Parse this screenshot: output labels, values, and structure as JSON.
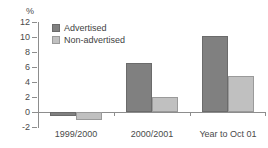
{
  "chart_data": {
    "type": "bar",
    "title": "",
    "subtitle": "",
    "unit_label": "%",
    "xlabel": "",
    "ylabel": "",
    "ylim": [
      -2,
      12
    ],
    "yticks": [
      -2,
      0,
      2,
      4,
      6,
      8,
      10,
      12
    ],
    "ytick_labels": [
      "-2",
      "0",
      "2",
      "4",
      "6",
      "8",
      "10",
      "12"
    ],
    "grid": false,
    "legend_position": "top-left",
    "categories": [
      "1999/2000",
      "2000/2001",
      "Year to Oct 01"
    ],
    "series": [
      {
        "name": "Advertised",
        "color": "#808080",
        "values": [
          -0.5,
          6.5,
          10.2
        ]
      },
      {
        "name": "Non-advertised",
        "color": "#c0c0c0",
        "values": [
          -1.1,
          2.0,
          4.8
        ]
      }
    ]
  },
  "axis": {
    "unit": "%",
    "ticks": [
      {
        "label": "12",
        "value": 12
      },
      {
        "label": "10",
        "value": 10
      },
      {
        "label": "8",
        "value": 8
      },
      {
        "label": "6",
        "value": 6
      },
      {
        "label": "4",
        "value": 4
      },
      {
        "label": "2",
        "value": 2
      },
      {
        "label": "0",
        "value": 0
      },
      {
        "label": "-2",
        "value": -2
      }
    ]
  },
  "legend": {
    "items": [
      {
        "label": "Advertised",
        "color": "#808080"
      },
      {
        "label": "Non-advertised",
        "color": "#c0c0c0"
      }
    ]
  },
  "categories": [
    {
      "label": "1999/2000"
    },
    {
      "label": "2000/2001"
    },
    {
      "label": "Year to Oct 01"
    }
  ],
  "colors": {
    "advertised": "#808080",
    "non_advertised": "#c0c0c0",
    "axis": "#8d8d8d",
    "text": "#4a4a4a",
    "background": "#ffffff"
  }
}
